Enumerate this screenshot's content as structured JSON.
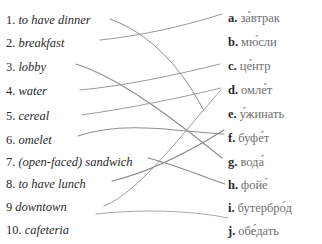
{
  "exercise": {
    "left_column": [
      {
        "marker": "1.",
        "text": "to have dinner"
      },
      {
        "marker": "2.",
        "text": "breakfast"
      },
      {
        "marker": "3.",
        "text": "lobby"
      },
      {
        "marker": "4.",
        "text": "water"
      },
      {
        "marker": "5.",
        "text": "cereal"
      },
      {
        "marker": "6.",
        "text": "omelet"
      },
      {
        "marker": "7.",
        "text": "(open-faced) sandwich"
      },
      {
        "marker": "8.",
        "text": "to have lunch"
      },
      {
        "marker": "9",
        "text": "downtown"
      },
      {
        "marker": "10.",
        "text": "cafeteria"
      }
    ],
    "right_column": [
      {
        "marker": "a.",
        "text": "за́втрак"
      },
      {
        "marker": "b.",
        "text": "мю́сли"
      },
      {
        "marker": "c.",
        "text": "це́нтр"
      },
      {
        "marker": "d.",
        "text": "омле́т"
      },
      {
        "marker": "e.",
        "text": "у́жинать"
      },
      {
        "marker": "f.",
        "text": "буфе́т"
      },
      {
        "marker": "g.",
        "text": "вода́"
      },
      {
        "marker": "h.",
        "text": "фойе́"
      },
      {
        "marker": "i.",
        "text": "бутербро́д"
      },
      {
        "marker": "j.",
        "text": "обе́дать"
      }
    ],
    "connections": [
      {
        "from": "1",
        "to": "e",
        "path": "M 110,19 C 140,30 175,55 204,111",
        "color": "#8d8d8d",
        "width": 1.0
      },
      {
        "from": "2",
        "to": "a",
        "path": "M 100,40 C 140,36 185,26 222,14",
        "color": "#9a9a9a",
        "width": 1.0
      },
      {
        "from": "3",
        "to": "h",
        "path": "M 76,64 C 120,78 175,120 222,158",
        "color": "#8a8a8a",
        "width": 1.1
      },
      {
        "from": "4",
        "to": "c",
        "path": "M 80,90 C 125,86 180,74 220,64",
        "color": "#9a9a9a",
        "width": 1.0
      },
      {
        "from": "5",
        "to": "d",
        "path": "M 82,115 C 130,108 180,98 221,88",
        "color": "#9e9e9e",
        "width": 1.0
      },
      {
        "from": "6",
        "to": "g",
        "path": "M 78,136 C 125,120 180,132 224,134",
        "color": "#909090",
        "width": 1.1
      },
      {
        "from": "7",
        "to": "i",
        "path": "M 148,158 C 180,166 205,178 225,184",
        "color": "#8a8a8a",
        "width": 1.1
      },
      {
        "from": "8",
        "to": "f",
        "path": "M 112,181 C 150,172 192,150 224,130",
        "color": "#888888",
        "width": 1.2
      },
      {
        "from": "9",
        "to": "d",
        "path": "M 104,206 C 140,192 185,130 221,90",
        "color": "#9c9c9c",
        "width": 1.0
      },
      {
        "from": "10",
        "to": "j",
        "path": "M 96,214 C 150,208 200,212 228,218",
        "color": "#a8a8a8",
        "width": 1.0
      }
    ]
  },
  "layout": {
    "left_rows_y": [
      8,
      31,
      55,
      79,
      104,
      128,
      150,
      172,
      195,
      218
    ],
    "right_rows_y": [
      6,
      30,
      54,
      78,
      102,
      126,
      150,
      173,
      196,
      219
    ]
  }
}
